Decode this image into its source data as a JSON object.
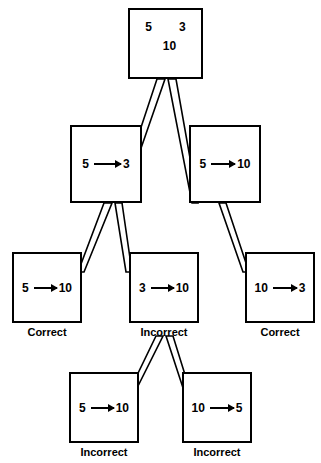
{
  "diagram": {
    "type": "problem-solving search tree",
    "nodes": [
      {
        "id": "root",
        "kind": "state",
        "operands": [
          "5",
          "3"
        ],
        "result": "10",
        "caption": ""
      },
      {
        "id": "n-l1-left",
        "kind": "operation",
        "from": "5",
        "arrow": "→",
        "to": "3",
        "caption": ""
      },
      {
        "id": "n-l1-right",
        "kind": "operation",
        "from": "5",
        "arrow": "→",
        "to": "10",
        "caption": ""
      },
      {
        "id": "n-l2-left",
        "kind": "operation",
        "from": "5",
        "arrow": "→",
        "to": "10",
        "caption": "Correct"
      },
      {
        "id": "n-l2-mid",
        "kind": "operation",
        "from": "3",
        "arrow": "→",
        "to": "10",
        "caption": "Incorrect"
      },
      {
        "id": "n-l2-right",
        "kind": "operation",
        "from": "10",
        "arrow": "→",
        "to": "3",
        "caption": "Correct"
      },
      {
        "id": "n-l3-left",
        "kind": "operation",
        "from": "5",
        "arrow": "→",
        "to": "10",
        "caption": "Incorrect"
      },
      {
        "id": "n-l3-right",
        "kind": "operation",
        "from": "10",
        "arrow": "→",
        "to": "5",
        "caption": "Incorrect"
      }
    ],
    "colors": {
      "stroke": "#000000",
      "background": "#ffffff",
      "text": "#000000"
    }
  }
}
